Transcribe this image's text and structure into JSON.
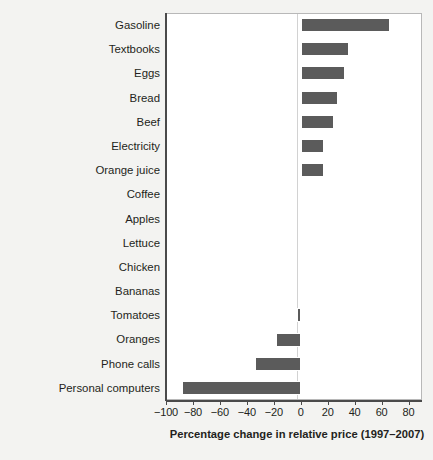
{
  "chart_data": {
    "type": "bar",
    "orientation": "horizontal",
    "title": "",
    "xlabel": "Percentage change in relative price (1997–2007)",
    "ylabel": "",
    "xlim": [
      -100,
      90
    ],
    "xticks": [
      -100,
      -80,
      -60,
      -40,
      -20,
      0,
      20,
      40,
      60,
      80
    ],
    "xticklabels": [
      "−100",
      "−80",
      "−60",
      "−40",
      "−20",
      "0",
      "20",
      "40",
      "60",
      "80"
    ],
    "grid": false,
    "legend": null,
    "bar_color": "#5b5b5b",
    "plot_background": "#ffffff",
    "figure_background": "#f3f3f1",
    "categories": [
      "Gasoline",
      "Textbooks",
      "Eggs",
      "Bread",
      "Beef",
      "Electricity",
      "Orange juice",
      "Coffee",
      "Apples",
      "Lettuce",
      "Chicken",
      "Bananas",
      "Tomatoes",
      "Oranges",
      "Phone calls",
      "Personal computers"
    ],
    "values": [
      66,
      36,
      33,
      28,
      25,
      17,
      17,
      2,
      2,
      0,
      1,
      -1,
      -3,
      -18,
      -34,
      -88
    ]
  }
}
